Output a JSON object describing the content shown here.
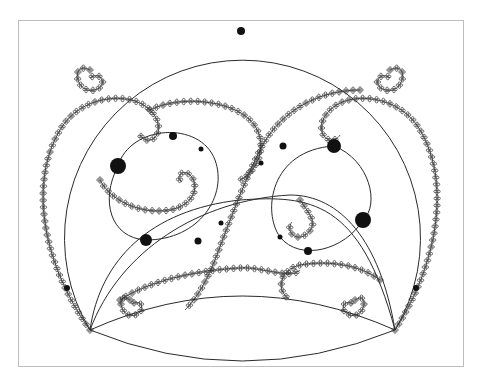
{
  "figure": {
    "frame": {
      "x": 18,
      "y": 20,
      "width": 446,
      "height": 347,
      "border_color": "#bdbdbd"
    },
    "colors": {
      "background": "#ffffff",
      "stroke": "#2a2a2a",
      "dot": "#111111"
    },
    "big_circle": {
      "cx": 241,
      "cy": 205,
      "r": 178
    },
    "lens": {
      "left_x": 90,
      "right_x": 395,
      "y": 330,
      "top_y": 297,
      "bottom_y": 357
    },
    "dots": [
      {
        "x": 241,
        "y": 31,
        "r": 4
      },
      {
        "x": 118,
        "y": 166,
        "r": 8
      },
      {
        "x": 173,
        "y": 136,
        "r": 4
      },
      {
        "x": 201,
        "y": 149,
        "r": 2.5
      },
      {
        "x": 146,
        "y": 240,
        "r": 6
      },
      {
        "x": 198,
        "y": 241,
        "r": 3.5
      },
      {
        "x": 221,
        "y": 223,
        "r": 2.5
      },
      {
        "x": 334,
        "y": 146,
        "r": 7
      },
      {
        "x": 283,
        "y": 146,
        "r": 3.5
      },
      {
        "x": 261,
        "y": 163,
        "r": 2.5
      },
      {
        "x": 363,
        "y": 220,
        "r": 8
      },
      {
        "x": 308,
        "y": 251,
        "r": 4
      },
      {
        "x": 280,
        "y": 237,
        "r": 2.5
      },
      {
        "x": 67,
        "y": 288,
        "r": 3
      },
      {
        "x": 416,
        "y": 288,
        "r": 3
      }
    ]
  }
}
